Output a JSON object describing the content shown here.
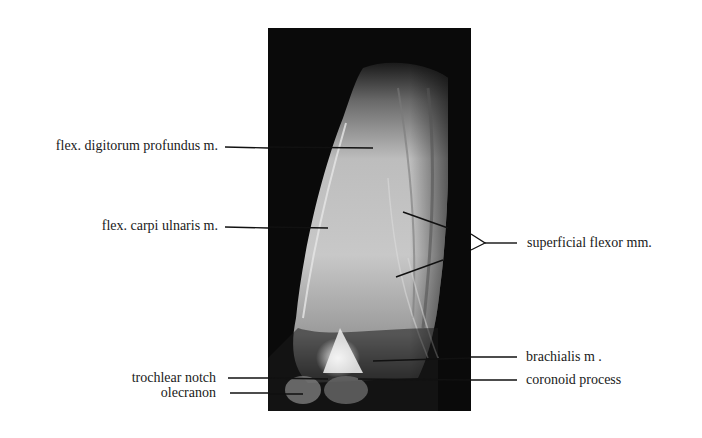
{
  "figure": {
    "image_alt": "MRI sagittal view of elbow and proximal forearm flexor muscles",
    "labels_left": [
      {
        "id": "fdp",
        "text": "flex. digitorum profundus m."
      },
      {
        "id": "fcu",
        "text": "flex. carpi  ulnaris m."
      },
      {
        "id": "trochlear",
        "text": "trochlear notch"
      },
      {
        "id": "olecranon",
        "text": "olecranon"
      }
    ],
    "labels_right": [
      {
        "id": "superficial",
        "text": "superficial  flexor mm."
      },
      {
        "id": "brachialis",
        "text": "brachialis m ."
      },
      {
        "id": "coronoid",
        "text": "coronoid process"
      }
    ]
  }
}
